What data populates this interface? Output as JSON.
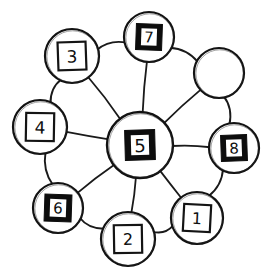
{
  "figure": {
    "kind": "hand-drawn-node-link-diagram",
    "style": "sketch",
    "background_color": "#ffffff",
    "ink_color": "#121212",
    "fill_dark_color": "#0d0d0d",
    "fill_light_color": "#ffffff"
  },
  "graph": {
    "topology": "wheel",
    "hub_id": "n5",
    "nodes": [
      {
        "id": "n5",
        "label": "5",
        "role": "hub",
        "shape": "circle-with-square",
        "square_fill": "dark",
        "label_color": "#ffffff",
        "cx": 140,
        "cy": 145,
        "r": 33,
        "square": 30,
        "font_size": 18,
        "rot": -1.5
      },
      {
        "id": "n7",
        "label": "7",
        "role": "rim",
        "shape": "circle-with-square",
        "square_fill": "dark",
        "label_color": "#ffffff",
        "cx": 149,
        "cy": 37,
        "r": 25,
        "square": 26,
        "font_size": 15,
        "rot": 2
      },
      {
        "id": "nEmpty",
        "label": "",
        "role": "rim",
        "shape": "circle-empty",
        "square_fill": "none",
        "label_color": "#101010",
        "cx": 219,
        "cy": 73,
        "r": 25,
        "square": 0,
        "font_size": 15,
        "rot": 0
      },
      {
        "id": "n8",
        "label": "8",
        "role": "rim",
        "shape": "circle-with-square",
        "square_fill": "dark",
        "label_color": "#ffffff",
        "cx": 234,
        "cy": 148,
        "r": 25,
        "square": 26,
        "font_size": 15,
        "rot": -2
      },
      {
        "id": "n1",
        "label": "1",
        "role": "rim",
        "shape": "circle-with-square",
        "square_fill": "light",
        "label_color": "#101010",
        "cx": 197,
        "cy": 218,
        "r": 26,
        "square": 27,
        "font_size": 16,
        "rot": 3
      },
      {
        "id": "n2",
        "label": "2",
        "role": "rim",
        "shape": "circle-with-square",
        "square_fill": "light",
        "label_color": "#101010",
        "cx": 128,
        "cy": 239,
        "r": 27,
        "square": 28,
        "font_size": 16,
        "rot": -1
      },
      {
        "id": "n6",
        "label": "6",
        "role": "rim",
        "shape": "circle-with-square",
        "square_fill": "dark",
        "label_color": "#ffffff",
        "cx": 58,
        "cy": 208,
        "r": 25,
        "square": 27,
        "font_size": 15,
        "rot": 2
      },
      {
        "id": "n4",
        "label": "4",
        "role": "rim",
        "shape": "circle-with-square",
        "square_fill": "light",
        "label_color": "#101010",
        "cx": 40,
        "cy": 127,
        "r": 27,
        "square": 28,
        "font_size": 17,
        "rot": 1
      },
      {
        "id": "n3",
        "label": "3",
        "role": "rim",
        "shape": "circle-with-square",
        "square_fill": "light",
        "label_color": "#101010",
        "cx": 72,
        "cy": 56,
        "r": 27,
        "square": 28,
        "font_size": 17,
        "rot": -2
      }
    ],
    "rim_order": [
      "n7",
      "nEmpty",
      "n8",
      "n1",
      "n2",
      "n6",
      "n4",
      "n3"
    ],
    "edges": [
      {
        "id": "e-5-7",
        "from": "n5",
        "to": "n7",
        "kind": "spoke"
      },
      {
        "id": "e-5-empty",
        "from": "n5",
        "to": "nEmpty",
        "kind": "spoke"
      },
      {
        "id": "e-5-8",
        "from": "n5",
        "to": "n8",
        "kind": "spoke"
      },
      {
        "id": "e-5-1",
        "from": "n5",
        "to": "n1",
        "kind": "spoke"
      },
      {
        "id": "e-5-2",
        "from": "n5",
        "to": "n2",
        "kind": "spoke"
      },
      {
        "id": "e-5-6",
        "from": "n5",
        "to": "n6",
        "kind": "spoke"
      },
      {
        "id": "e-5-4",
        "from": "n5",
        "to": "n4",
        "kind": "spoke"
      },
      {
        "id": "e-5-3",
        "from": "n5",
        "to": "n3",
        "kind": "spoke"
      },
      {
        "id": "e-7-empty",
        "from": "n7",
        "to": "nEmpty",
        "kind": "rim"
      },
      {
        "id": "e-empty-8",
        "from": "nEmpty",
        "to": "n8",
        "kind": "rim"
      },
      {
        "id": "e-8-1",
        "from": "n8",
        "to": "n1",
        "kind": "rim"
      },
      {
        "id": "e-1-2",
        "from": "n1",
        "to": "n2",
        "kind": "rim"
      },
      {
        "id": "e-2-6",
        "from": "n2",
        "to": "n6",
        "kind": "rim"
      },
      {
        "id": "e-6-4",
        "from": "n6",
        "to": "n4",
        "kind": "rim"
      },
      {
        "id": "e-4-3",
        "from": "n4",
        "to": "n3",
        "kind": "rim"
      },
      {
        "id": "e-3-7",
        "from": "n3",
        "to": "n7",
        "kind": "rim"
      }
    ]
  }
}
